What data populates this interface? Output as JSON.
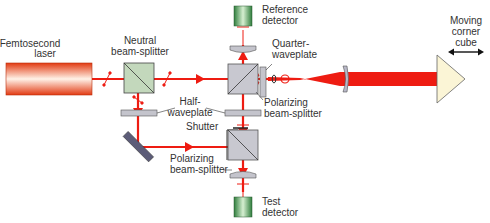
{
  "diagram": {
    "colors": {
      "beam": "#ee1c12",
      "laser_dark": "#e0401a",
      "laser_light": "#fff0e6",
      "splitter_neutral": "#c3d8bc",
      "splitter_polarizing": "#c8c8d0",
      "optic_gray": "#c4c4cc",
      "detector_dark": "#2e7a3a",
      "detector_light": "#d9f0d4",
      "corner_cube": "#fbf5d6",
      "label": "#333333"
    },
    "labels": {
      "laser_line1": "Femtosecond",
      "laser_line2": "laser",
      "neutral_bs_line1": "Neutral",
      "neutral_bs_line2": "beam-splitter",
      "ref_det_line1": "Reference",
      "ref_det_line2": "detector",
      "qwp_line1": "Quarter-",
      "qwp_line2": "waveplate",
      "pbs1_line1": "Polarizing",
      "pbs1_line2": "beam-splitter",
      "hwp_line1": "Half-",
      "hwp_line2": "waveplate",
      "shutter": "Shutter",
      "pbs2_line1": "Polarizing",
      "pbs2_line2": "beam-splitter",
      "test_det_line1": "Test",
      "test_det_line2": "detector",
      "cube_line1": "Moving",
      "cube_line2": "corner",
      "cube_line3": "cube"
    },
    "components": [
      {
        "id": "femtosecond-laser",
        "type": "laser"
      },
      {
        "id": "neutral-beam-splitter",
        "type": "beam-splitter"
      },
      {
        "id": "polarizing-beam-splitter-top",
        "type": "beam-splitter"
      },
      {
        "id": "polarizing-beam-splitter-bottom",
        "type": "beam-splitter"
      },
      {
        "id": "quarter-waveplate",
        "type": "waveplate"
      },
      {
        "id": "half-waveplate-left",
        "type": "waveplate"
      },
      {
        "id": "half-waveplate-right",
        "type": "waveplate"
      },
      {
        "id": "shutter",
        "type": "shutter"
      },
      {
        "id": "mirror",
        "type": "mirror"
      },
      {
        "id": "reference-detector",
        "type": "detector"
      },
      {
        "id": "test-detector",
        "type": "detector"
      },
      {
        "id": "focusing-lens",
        "type": "lens"
      },
      {
        "id": "moving-corner-cube",
        "type": "retroreflector"
      }
    ]
  }
}
